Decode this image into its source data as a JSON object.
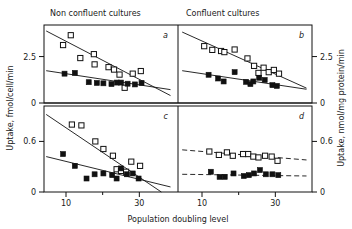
{
  "figure": {
    "column_titles": [
      "Non confluent cultures",
      "Confluent cultures"
    ],
    "x_axis_label": "Population doubling level",
    "y_axis_label_left": "Uptake, fmol/cell/min",
    "y_axis_label_right": "Uptake, nmol/mg protein/min",
    "panel_labels": [
      "a",
      "b",
      "c",
      "d"
    ],
    "x_ticks": [
      "10",
      "30"
    ],
    "y_ticks_top": [
      "2.5",
      "0"
    ],
    "y_ticks_bottom": [
      "0.6",
      "0"
    ],
    "colors": {
      "ink": "#111111",
      "paper": "#ffffff"
    }
  },
  "chart_data": [
    {
      "type": "scatter",
      "panel": "a",
      "title": "Non confluent cultures",
      "xlabel": "Population doubling level",
      "ylabel": "Uptake, fmol/cell/min",
      "xlim": [
        4,
        40
      ],
      "ylim": [
        0,
        4.2
      ],
      "xticks": [
        10,
        30
      ],
      "yticks": [
        0,
        2.5
      ],
      "grid": false,
      "legend": "none",
      "series": [
        {
          "name": "open-squares",
          "marker": "open-square",
          "points": [
            {
              "x": 9.2,
              "y": 3.12
            },
            {
              "x": 11.3,
              "y": 3.65
            },
            {
              "x": 13.9,
              "y": 2.42
            },
            {
              "x": 17.6,
              "y": 2.63
            },
            {
              "x": 17.8,
              "y": 2.08
            },
            {
              "x": 21.6,
              "y": 1.93
            },
            {
              "x": 23.1,
              "y": 1.8
            },
            {
              "x": 24.6,
              "y": 1.53
            },
            {
              "x": 26.0,
              "y": 0.82
            },
            {
              "x": 28.2,
              "y": 1.58
            },
            {
              "x": 30.4,
              "y": 1.72
            }
          ],
          "fit": {
            "kind": "solid",
            "x1": 4.6,
            "y1": 3.88,
            "x2": 38.5,
            "y2": 0.4
          }
        },
        {
          "name": "closed-squares",
          "marker": "closed-square",
          "points": [
            {
              "x": 9.6,
              "y": 1.58
            },
            {
              "x": 12.4,
              "y": 1.62
            },
            {
              "x": 16.2,
              "y": 1.12
            },
            {
              "x": 18.4,
              "y": 1.08
            },
            {
              "x": 20.2,
              "y": 1.06
            },
            {
              "x": 22.4,
              "y": 1.02
            },
            {
              "x": 23.9,
              "y": 1.1
            },
            {
              "x": 25.0,
              "y": 1.1
            },
            {
              "x": 26.8,
              "y": 1.04
            },
            {
              "x": 28.8,
              "y": 1.0
            },
            {
              "x": 30.6,
              "y": 1.08
            }
          ],
          "fit": {
            "kind": "solid",
            "x1": 4.6,
            "y1": 1.74,
            "x2": 38.5,
            "y2": 0.72
          }
        }
      ]
    },
    {
      "type": "scatter",
      "panel": "b",
      "title": "Confluent cultures",
      "xlabel": "Population doubling level",
      "ylabel": "Uptake, nmol/mg protein/min",
      "xlim": [
        4,
        40
      ],
      "ylim": [
        0,
        4.2
      ],
      "xticks": [
        10,
        30
      ],
      "yticks": [
        0,
        2.5
      ],
      "grid": false,
      "legend": "none",
      "series": [
        {
          "name": "open-squares",
          "marker": "open-square",
          "points": [
            {
              "x": 10.6,
              "y": 3.06
            },
            {
              "x": 12.8,
              "y": 2.86
            },
            {
              "x": 15.2,
              "y": 2.8
            },
            {
              "x": 16.1,
              "y": 2.74
            },
            {
              "x": 18.9,
              "y": 2.88
            },
            {
              "x": 22.4,
              "y": 2.4
            },
            {
              "x": 24.2,
              "y": 2.0
            },
            {
              "x": 25.4,
              "y": 1.62
            },
            {
              "x": 26.8,
              "y": 1.9
            },
            {
              "x": 28.2,
              "y": 1.66
            },
            {
              "x": 29.6,
              "y": 1.78
            },
            {
              "x": 31.0,
              "y": 1.58
            }
          ],
          "fit": {
            "kind": "solid",
            "x1": 4.6,
            "y1": 3.82,
            "x2": 38.5,
            "y2": 0.8
          }
        },
        {
          "name": "closed-squares",
          "marker": "closed-square",
          "points": [
            {
              "x": 11.8,
              "y": 1.52
            },
            {
              "x": 14.4,
              "y": 1.32
            },
            {
              "x": 15.9,
              "y": 1.16
            },
            {
              "x": 18.9,
              "y": 1.66
            },
            {
              "x": 22.0,
              "y": 1.14
            },
            {
              "x": 23.2,
              "y": 1.02
            },
            {
              "x": 24.0,
              "y": 1.16
            },
            {
              "x": 25.6,
              "y": 1.36
            },
            {
              "x": 27.1,
              "y": 1.24
            },
            {
              "x": 29.2,
              "y": 0.96
            },
            {
              "x": 30.4,
              "y": 0.92
            }
          ],
          "fit": {
            "kind": "solid",
            "x1": 4.6,
            "y1": 1.74,
            "x2": 38.5,
            "y2": 0.74
          }
        }
      ]
    },
    {
      "type": "scatter",
      "panel": "c",
      "title": "Non confluent cultures",
      "xlabel": "Population doubling level",
      "ylabel": "Uptake, fmol/cell/min",
      "xlim": [
        4,
        40
      ],
      "ylim": [
        0,
        1.02
      ],
      "xticks": [
        10,
        30
      ],
      "yticks": [
        0,
        0.6
      ],
      "grid": false,
      "legend": "none",
      "series": [
        {
          "name": "open-squares",
          "marker": "open-square",
          "points": [
            {
              "x": 11.6,
              "y": 0.8
            },
            {
              "x": 14.2,
              "y": 0.79
            },
            {
              "x": 18.0,
              "y": 0.6
            },
            {
              "x": 20.2,
              "y": 0.51
            },
            {
              "x": 22.8,
              "y": 0.43
            },
            {
              "x": 23.8,
              "y": 0.27
            },
            {
              "x": 25.0,
              "y": 0.25
            },
            {
              "x": 26.4,
              "y": 0.24
            },
            {
              "x": 27.8,
              "y": 0.36
            },
            {
              "x": 30.2,
              "y": 0.31
            }
          ],
          "fit": {
            "kind": "solid",
            "x1": 4.6,
            "y1": 0.92,
            "x2": 36.0,
            "y2": 0.0
          }
        },
        {
          "name": "closed-squares",
          "marker": "closed-square",
          "points": [
            {
              "x": 9.2,
              "y": 0.45
            },
            {
              "x": 12.4,
              "y": 0.31
            },
            {
              "x": 15.6,
              "y": 0.16
            },
            {
              "x": 17.8,
              "y": 0.21
            },
            {
              "x": 20.2,
              "y": 0.22
            },
            {
              "x": 22.6,
              "y": 0.2
            },
            {
              "x": 23.8,
              "y": 0.16
            },
            {
              "x": 25.0,
              "y": 0.28
            },
            {
              "x": 26.6,
              "y": 0.21
            },
            {
              "x": 28.2,
              "y": 0.22
            },
            {
              "x": 29.8,
              "y": 0.16
            }
          ],
          "fit": {
            "kind": "solid",
            "x1": 4.6,
            "y1": 0.42,
            "x2": 38.5,
            "y2": 0.06
          }
        }
      ]
    },
    {
      "type": "scatter",
      "panel": "d",
      "title": "Confluent cultures",
      "xlabel": "Population doubling level",
      "ylabel": "Uptake, nmol/mg protein/min",
      "xlim": [
        4,
        40
      ],
      "ylim": [
        0,
        1.02
      ],
      "xticks": [
        10,
        30
      ],
      "yticks": [
        0,
        0.6
      ],
      "grid": false,
      "legend": "none",
      "series": [
        {
          "name": "open-squares",
          "marker": "open-square",
          "points": [
            {
              "x": 12.0,
              "y": 0.48
            },
            {
              "x": 14.6,
              "y": 0.44
            },
            {
              "x": 16.8,
              "y": 0.47
            },
            {
              "x": 18.4,
              "y": 0.43
            },
            {
              "x": 21.2,
              "y": 0.45
            },
            {
              "x": 22.6,
              "y": 0.45
            },
            {
              "x": 24.0,
              "y": 0.42
            },
            {
              "x": 25.4,
              "y": 0.41
            },
            {
              "x": 27.2,
              "y": 0.43
            },
            {
              "x": 29.0,
              "y": 0.42
            },
            {
              "x": 30.6,
              "y": 0.37
            }
          ],
          "fit": {
            "kind": "dashed",
            "x1": 4.6,
            "y1": 0.5,
            "x2": 38.5,
            "y2": 0.38
          }
        },
        {
          "name": "closed-squares",
          "marker": "closed-square",
          "points": [
            {
              "x": 12.4,
              "y": 0.24
            },
            {
              "x": 14.8,
              "y": 0.18
            },
            {
              "x": 16.2,
              "y": 0.18
            },
            {
              "x": 18.6,
              "y": 0.22
            },
            {
              "x": 21.4,
              "y": 0.19
            },
            {
              "x": 22.8,
              "y": 0.2
            },
            {
              "x": 24.2,
              "y": 0.22
            },
            {
              "x": 25.8,
              "y": 0.26
            },
            {
              "x": 27.4,
              "y": 0.21
            },
            {
              "x": 29.2,
              "y": 0.21
            },
            {
              "x": 30.8,
              "y": 0.2
            }
          ],
          "fit": {
            "kind": "dashed",
            "x1": 4.6,
            "y1": 0.21,
            "x2": 38.5,
            "y2": 0.19
          }
        }
      ]
    }
  ]
}
